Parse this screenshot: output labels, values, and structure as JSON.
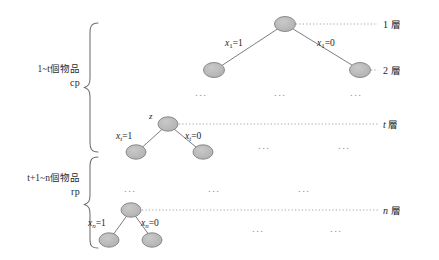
{
  "figure": {
    "type": "binary-decision-tree-diagram",
    "background": "#ffffff",
    "node_fill": "#b4b4b4",
    "node_stroke": "#7d7d7d",
    "edge_color": "#6e6e6e",
    "dotted_color": "#9a9a9a",
    "brace_color": "#6e6e6e"
  },
  "groups": [
    {
      "id": "cp",
      "range_label": "1~t個物品",
      "range_prefix": "1~",
      "range_var": "t",
      "range_suffix": "個物品",
      "name_label": "cp"
    },
    {
      "id": "rp",
      "range_label": "t+1~n個物品",
      "range_prefix": "",
      "range_var": "t",
      "range_suffix": "+1~n個物品",
      "name_label": "rp"
    }
  ],
  "layers": [
    {
      "id": "layer-1",
      "label": "1 層",
      "index": "1",
      "unit": "層"
    },
    {
      "id": "layer-2",
      "label": "2 層",
      "index": "2",
      "unit": "層"
    },
    {
      "id": "layer-t",
      "label": "t 層",
      "index": "t",
      "unit": "層"
    },
    {
      "id": "layer-n",
      "label": "n 層",
      "index": "n",
      "unit": "層"
    }
  ],
  "trees": {
    "top": {
      "root_label": "",
      "left_edge_label": "x₁=1",
      "left_edge_var": "x",
      "left_edge_sub": "1",
      "left_edge_value": "=1",
      "right_edge_label": "x₁=0",
      "right_edge_var": "x",
      "right_edge_sub": "1",
      "right_edge_value": "=0"
    },
    "middle": {
      "root_label": "z",
      "left_edge_var": "x",
      "left_edge_sub": "t",
      "left_edge_value": "=1",
      "right_edge_var": "x",
      "right_edge_sub": "t",
      "right_edge_value": "=0"
    },
    "bottom": {
      "root_label": "",
      "left_edge_var": "x",
      "left_edge_sub": "n",
      "left_edge_value": "=1",
      "right_edge_var": "x",
      "right_edge_sub": "n",
      "right_edge_value": "=0"
    }
  },
  "ellipses": {
    "glyph": "...",
    "rows": [
      {
        "id": "row-after-layer2",
        "count": 3
      },
      {
        "id": "row-after-layert",
        "count": 2
      },
      {
        "id": "row-rp-middle",
        "count": 3
      },
      {
        "id": "row-after-layern",
        "count": 2
      }
    ]
  }
}
